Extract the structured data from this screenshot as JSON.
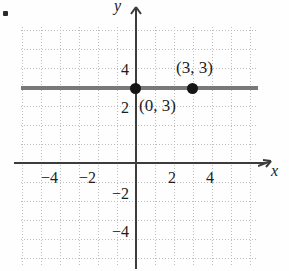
{
  "figure": {
    "kind": "coordinate-plane",
    "bullet": "•"
  },
  "axes": {
    "x_label": "x",
    "y_label": "y",
    "x_arrow_icon": "arrow-right-icon",
    "y_arrow_icon": "arrow-up-icon"
  },
  "ticks": {
    "x": [
      {
        "label": "−4",
        "value": -4
      },
      {
        "label": "−2",
        "value": -2
      },
      {
        "label": "2",
        "value": 2
      },
      {
        "label": "4",
        "value": 4
      }
    ],
    "y": [
      {
        "label": "4",
        "value": 4
      },
      {
        "label": "2",
        "value": 2
      },
      {
        "label": "−2",
        "value": -2
      },
      {
        "label": "−4",
        "value": -4
      }
    ]
  },
  "points": [
    {
      "label": "(0, 3)",
      "x": 0,
      "y": 3
    },
    {
      "label": "(3, 3)",
      "x": 3,
      "y": 3
    }
  ],
  "chart_data": {
    "type": "line",
    "title": "",
    "xlabel": "x",
    "ylabel": "y",
    "xlim": [
      -6,
      6.5
    ],
    "ylim": [
      -6,
      6.5
    ],
    "grid": true,
    "legend": null,
    "series": [
      {
        "name": "y = 3",
        "equation": "y = 3",
        "x": [
          -6,
          6.5
        ],
        "values": [
          3,
          3
        ],
        "style": "solid-thick-gray"
      }
    ],
    "annotations": [
      {
        "text": "(0, 3)",
        "x": 0,
        "y": 3,
        "position": "right-below"
      },
      {
        "text": "(3, 3)",
        "x": 3,
        "y": 3,
        "position": "above"
      }
    ],
    "markers": [
      {
        "x": 0,
        "y": 3
      },
      {
        "x": 3,
        "y": 3
      }
    ],
    "xticks": [
      -4,
      -2,
      2,
      4
    ],
    "yticks": [
      -4,
      -2,
      2,
      4
    ],
    "xticklabels": [
      "−4",
      "−2",
      "2",
      "4"
    ],
    "yticklabels": [
      "−4",
      "−2",
      "2",
      "4"
    ]
  }
}
